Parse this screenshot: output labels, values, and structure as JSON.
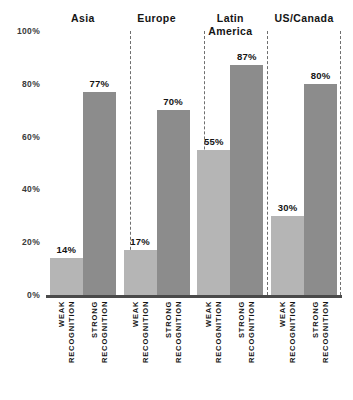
{
  "chart_data": {
    "type": "bar",
    "title": "",
    "xlabel": "",
    "ylabel": "",
    "ylim": [
      0,
      100
    ],
    "grid": false,
    "legend_position": "none",
    "value_suffix": "%",
    "yticks": [
      "100%",
      "80%",
      "60%",
      "40%",
      "20%",
      "0%"
    ],
    "ytick_values": [
      100,
      80,
      60,
      40,
      20,
      0
    ],
    "categories": [
      "Asia",
      "Europe",
      "Latin America",
      "US/Canada"
    ],
    "category_lines": [
      [
        "Asia"
      ],
      [
        "Europe"
      ],
      [
        "Latin",
        "America"
      ],
      [
        "US/Canada"
      ]
    ],
    "subcategories": [
      "WEAK RECOGNITION",
      "STRONG RECOGNITION"
    ],
    "subcategory_lines": [
      [
        "WEAK",
        "RECOGNITION"
      ],
      [
        "STRONG",
        "RECOGNITION"
      ]
    ],
    "series": [
      {
        "name": "WEAK RECOGNITION",
        "color": "#b5b5b5",
        "values": [
          14,
          17,
          55,
          30
        ]
      },
      {
        "name": "STRONG RECOGNITION",
        "color": "#8c8c8c",
        "values": [
          77,
          70,
          87,
          80
        ]
      }
    ],
    "bar_labels": [
      [
        "14%",
        "77%"
      ],
      [
        "17%",
        "70%"
      ],
      [
        "55%",
        "87%"
      ],
      [
        "30%",
        "80%"
      ]
    ],
    "colors": {
      "weak": "#b5b5b5",
      "strong": "#8c8c8c",
      "axis": "#4a4a4a",
      "separator": "#6e6e6e",
      "text": "#141414",
      "background": "#ffffff"
    }
  }
}
